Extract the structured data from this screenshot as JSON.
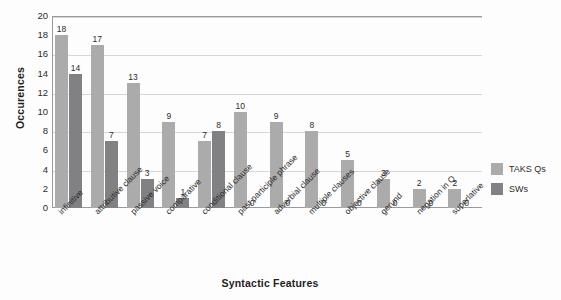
{
  "chart_data": {
    "type": "bar",
    "title": "",
    "xlabel": "Syntactic Features",
    "ylabel": "Occurences",
    "ylim": [
      0,
      20
    ],
    "ytick_step": 2,
    "gridline_step": 4,
    "grid": true,
    "legend_position": "right",
    "categories": [
      "infinitive",
      "attributive clause",
      "passive voice",
      "comparative",
      "conditional clause",
      "past participle phrase",
      "adverbial clause",
      "multiple clauses",
      "objective clause",
      "gerund",
      "negation in Q",
      "superlative"
    ],
    "yticks": [
      "0",
      "2",
      "4",
      "6",
      "8",
      "10",
      "12",
      "14",
      "16",
      "18",
      "20"
    ],
    "series": [
      {
        "name": "TAKS Qs",
        "color": "#ababac",
        "values": [
          18,
          17,
          13,
          9,
          7,
          10,
          9,
          8,
          5,
          3,
          2,
          2
        ]
      },
      {
        "name": "SWs",
        "color": "#818183",
        "values": [
          14,
          7,
          3,
          1,
          8,
          0,
          0,
          0,
          0,
          0,
          0,
          0
        ]
      }
    ]
  },
  "colors": {
    "series_taks": "#ababac",
    "series_sws": "#818183",
    "gridline": "#d6d6d6",
    "axis": "#9a9a9a",
    "text": "#2b2b2b",
    "background": "#fdfdfd"
  }
}
